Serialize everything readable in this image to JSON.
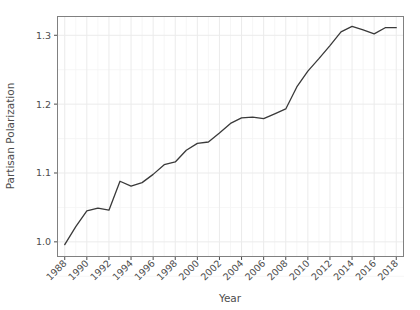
{
  "chart_data": {
    "type": "line",
    "title": "",
    "xlabel": "Year",
    "ylabel": "Partisan Polarization",
    "x": [
      1988,
      1989,
      1990,
      1991,
      1992,
      1993,
      1994,
      1995,
      1996,
      1997,
      1998,
      1999,
      2000,
      2001,
      2002,
      2003,
      2004,
      2005,
      2006,
      2007,
      2008,
      2009,
      2010,
      2011,
      2012,
      2013,
      2014,
      2015,
      2016,
      2017,
      2018
    ],
    "values": [
      0.996,
      1.022,
      1.045,
      1.049,
      1.046,
      1.088,
      1.081,
      1.086,
      1.098,
      1.112,
      1.116,
      1.133,
      1.143,
      1.145,
      1.158,
      1.172,
      1.18,
      1.181,
      1.179,
      1.186,
      1.193,
      1.225,
      1.248,
      1.266,
      1.285,
      1.305,
      1.313,
      1.308,
      1.302,
      1.311,
      1.311
    ],
    "series": [
      {
        "name": "Partisan Polarization",
        "color": "#3a3a3a",
        "values": [
          0.996,
          1.022,
          1.045,
          1.049,
          1.046,
          1.088,
          1.081,
          1.086,
          1.098,
          1.112,
          1.116,
          1.133,
          1.143,
          1.145,
          1.158,
          1.172,
          1.18,
          1.181,
          1.179,
          1.186,
          1.193,
          1.225,
          1.248,
          1.266,
          1.285,
          1.305,
          1.313,
          1.308,
          1.302,
          1.311,
          1.311
        ]
      }
    ],
    "xlim": [
      1987.3,
      2018.7
    ],
    "ylim": [
      0.978,
      1.328
    ],
    "xticks": [
      1988,
      1990,
      1992,
      1994,
      1996,
      1998,
      2000,
      2002,
      2004,
      2006,
      2008,
      2010,
      2012,
      2014,
      2016,
      2018
    ],
    "xticklabels": [
      "1988",
      "1990",
      "1992",
      "1994",
      "1996",
      "1998",
      "2000",
      "2002",
      "2004",
      "2006",
      "2008",
      "2010",
      "2012",
      "2014",
      "2016",
      "2018"
    ],
    "yticks": [
      1.0,
      1.1,
      1.2,
      1.3
    ],
    "yticklabels": [
      "1.0",
      "1.1",
      "1.2",
      "1.3"
    ],
    "grid": true,
    "minor_grid": true,
    "legend": "none",
    "xtick_label_rotation": 45,
    "panel_background": "#ffffff",
    "grid_color": "#ebebeb",
    "minor_grid_color": "#f4f4f4",
    "panel_border_color": "#808080",
    "line_color": "#3a3a3a",
    "line_width": 1.3,
    "text_color": "#4d4d4d"
  },
  "plot_geometry": {
    "left": 57,
    "right": 404,
    "top": 16,
    "bottom": 257
  },
  "labels": {
    "y_axis_title": "Partisan Polarization",
    "x_axis_title": "Year"
  }
}
